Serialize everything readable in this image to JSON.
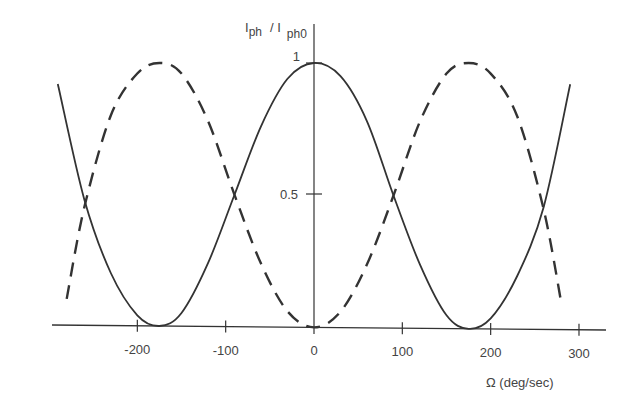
{
  "chart_data": {
    "type": "line",
    "title": "",
    "xlabel": "Ω  (deg/sec)",
    "ylabel": "I_ph / I_ph0",
    "ylabel_parts": {
      "main": "I",
      "sub1": "ph",
      "sep": "/ I",
      "sub2": "ph0"
    },
    "xlim": [
      -300,
      300
    ],
    "ylim": [
      0,
      1
    ],
    "x_ticks": [
      -200,
      -100,
      0,
      100,
      200,
      300
    ],
    "x_tick_labels": [
      "-200",
      "-100",
      "0",
      "100",
      "200",
      "300"
    ],
    "y_ticks": [
      0.5,
      1
    ],
    "y_tick_labels": [
      "0.5",
      "1"
    ],
    "grid": false,
    "legend": null,
    "series": [
      {
        "name": "solid",
        "style": "solid",
        "x": [
          -290,
          -260,
          -230,
          -200,
          -175,
          -150,
          -120,
          -90,
          -60,
          -30,
          0,
          30,
          60,
          90,
          120,
          150,
          175,
          200,
          230,
          260,
          290
        ],
        "y": [
          0.92,
          0.48,
          0.2,
          0.04,
          0.0,
          0.05,
          0.24,
          0.5,
          0.76,
          0.94,
          1.0,
          0.95,
          0.78,
          0.5,
          0.24,
          0.05,
          0.0,
          0.04,
          0.2,
          0.46,
          0.92
        ]
      },
      {
        "name": "dashed",
        "style": "dashed",
        "x": [
          -280,
          -260,
          -230,
          -200,
          -175,
          -150,
          -120,
          -90,
          -60,
          -30,
          0,
          30,
          60,
          90,
          120,
          150,
          175,
          200,
          230,
          260,
          280
        ],
        "y": [
          0.1,
          0.45,
          0.8,
          0.96,
          1.0,
          0.96,
          0.78,
          0.5,
          0.24,
          0.06,
          0.0,
          0.06,
          0.24,
          0.5,
          0.78,
          0.96,
          1.0,
          0.96,
          0.8,
          0.45,
          0.1
        ]
      }
    ]
  }
}
